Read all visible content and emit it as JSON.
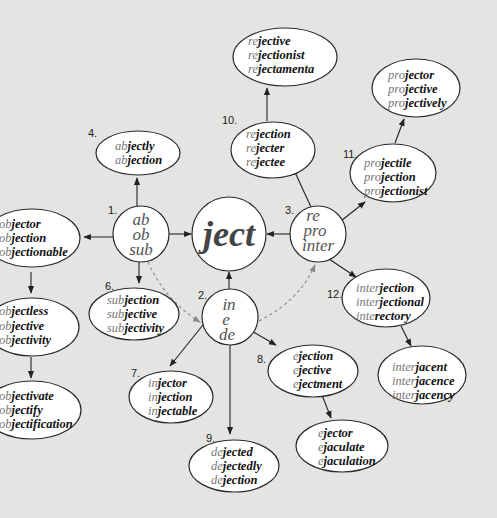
{
  "center": {
    "label": "ject"
  },
  "hubs": [
    {
      "id": "hub-1",
      "number": "1.",
      "prefixes": [
        "ab",
        "ob",
        "sub"
      ]
    },
    {
      "id": "hub-2",
      "number": "2.",
      "prefixes": [
        "in",
        "e",
        "de"
      ]
    },
    {
      "id": "hub-3",
      "number": "3.",
      "prefixes": [
        "re",
        "pro",
        "inter"
      ]
    }
  ],
  "groups": {
    "g4": {
      "number": "4.",
      "words": [
        [
          "ab",
          "jectly"
        ],
        [
          "ab",
          "jection"
        ]
      ]
    },
    "g5": {
      "number": "5.",
      "words": [
        [
          "ob",
          "jector"
        ],
        [
          "ob",
          "jection"
        ],
        [
          "ob",
          "jectionable"
        ]
      ]
    },
    "g5b": {
      "number": "",
      "words": [
        [
          "ob",
          "jectless"
        ],
        [
          "ob",
          "jective"
        ],
        [
          "ob",
          "jectivity"
        ]
      ]
    },
    "g5c": {
      "number": "",
      "words": [
        [
          "ob",
          "jectivate"
        ],
        [
          "ob",
          "jectify"
        ],
        [
          "ob",
          "jectification"
        ]
      ]
    },
    "g6": {
      "number": "6.",
      "words": [
        [
          "sub",
          "jection"
        ],
        [
          "sub",
          "jective"
        ],
        [
          "sub",
          "jectivity"
        ]
      ]
    },
    "g7": {
      "number": "7.",
      "words": [
        [
          "in",
          "jector"
        ],
        [
          "in",
          "jection"
        ],
        [
          "in",
          "jectable"
        ]
      ]
    },
    "g8": {
      "number": "8.",
      "words": [
        [
          "e",
          "jection"
        ],
        [
          "e",
          "jective"
        ],
        [
          "e",
          "jectment"
        ]
      ]
    },
    "g8b": {
      "number": "",
      "words": [
        [
          "e",
          "jector"
        ],
        [
          "e",
          "jaculate"
        ],
        [
          "e",
          "jaculation"
        ]
      ]
    },
    "g9": {
      "number": "9.",
      "words": [
        [
          "de",
          "jected"
        ],
        [
          "de",
          "jectedly"
        ],
        [
          "de",
          "jection"
        ]
      ]
    },
    "g10": {
      "number": "10.",
      "words": [
        [
          "re",
          "jection"
        ],
        [
          "re",
          "jecter"
        ],
        [
          "re",
          "jectee"
        ]
      ]
    },
    "g10b": {
      "number": "",
      "words": [
        [
          "re",
          "jective"
        ],
        [
          "re",
          "jectionist"
        ],
        [
          "re",
          "jectamenta"
        ]
      ]
    },
    "g11": {
      "number": "11.",
      "words": [
        [
          "pro",
          "jectile"
        ],
        [
          "pro",
          "jection"
        ],
        [
          "pro",
          "jectionist"
        ]
      ]
    },
    "g11b": {
      "number": "",
      "words": [
        [
          "pro",
          "jector"
        ],
        [
          "pro",
          "jective"
        ],
        [
          "pro",
          "jectively"
        ]
      ]
    },
    "g12": {
      "number": "12.",
      "words": [
        [
          "inter",
          "jection"
        ],
        [
          "inter",
          "jectional"
        ],
        [
          "inte",
          "rectory"
        ]
      ]
    },
    "g12b": {
      "number": "",
      "words": [
        [
          "inter",
          "jacent"
        ],
        [
          "inter",
          "jacence"
        ],
        [
          "inter",
          "jacency"
        ]
      ]
    }
  },
  "colors": {
    "background": "#e4e4e2",
    "node_fill": "#ffffff",
    "prefix_text": "#777777",
    "root_text": "#111111",
    "dashed_edge": "#888888"
  }
}
